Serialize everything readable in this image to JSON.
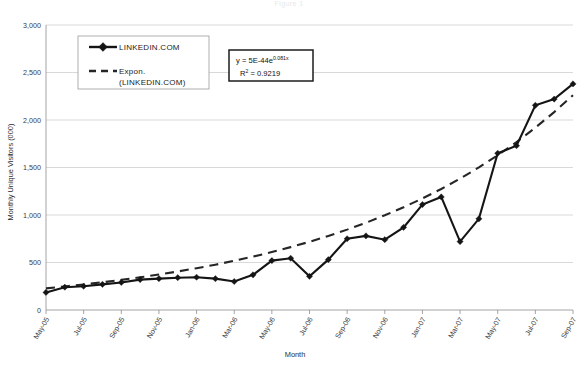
{
  "figure": {
    "title_faint": "Figure 1"
  },
  "chart_data": {
    "type": "line",
    "title": "",
    "xlabel": "Month",
    "ylabel": "Monthly Unique Visitors (000)",
    "ylim": [
      0,
      3000
    ],
    "ytick_labels": [
      "0",
      "500",
      "1,000",
      "1,500",
      "2,000",
      "2,500",
      "3,000"
    ],
    "ytick_values": [
      0,
      500,
      1000,
      1500,
      2000,
      2500,
      3000
    ],
    "grid": true,
    "legend_position": "upper-left-inside",
    "x": [
      "May-05",
      "Jun-05",
      "Jul-05",
      "Aug-05",
      "Sep-05",
      "Oct-05",
      "Nov-05",
      "Dec-05",
      "Jan-06",
      "Feb-06",
      "Mar-06",
      "Apr-06",
      "May-06",
      "Jun-06",
      "Jul-06",
      "Aug-06",
      "Sep-06",
      "Oct-06",
      "Nov-06",
      "Dec-06",
      "Jan-07",
      "Feb-07",
      "Mar-07",
      "Apr-07",
      "May-07",
      "Jun-07",
      "Jul-07",
      "Aug-07",
      "Sep-07"
    ],
    "xtick_labels": [
      "May-05",
      "Jul-05",
      "Sep-05",
      "Nov-05",
      "Jan-06",
      "Mar-06",
      "May-06",
      "Jul-06",
      "Sep-06",
      "Nov-06",
      "Jan-07",
      "Mar-07",
      "May-07",
      "Jul-07",
      "Sep-07"
    ],
    "series": [
      {
        "name": "LINKEDIN.COM",
        "style": "solid-with-diamond-markers",
        "values": [
          185,
          240,
          250,
          270,
          290,
          320,
          330,
          340,
          345,
          330,
          300,
          370,
          520,
          545,
          355,
          530,
          750,
          780,
          740,
          870,
          1110,
          1190,
          720,
          960,
          1650,
          1730,
          2155,
          2220,
          2380
        ]
      },
      {
        "name": "Expon. (LINKEDIN.COM)",
        "style": "dashed",
        "values": [
          228,
          248,
          269,
          292,
          317,
          344,
          373,
          405,
          440,
          477,
          518,
          562,
          610,
          662,
          718,
          780,
          846,
          918,
          997,
          1082,
          1174,
          1274,
          1383,
          1501,
          1629,
          1768,
          1919,
          2083,
          2261
        ]
      }
    ],
    "legend": [
      {
        "label": "LINKEDIN.COM",
        "marker": "solid-line-diamond"
      },
      {
        "label": "Expon.",
        "label2": "(LINKEDIN.COM)",
        "marker": "dashed-line"
      }
    ],
    "annotation": {
      "equation_prefix": "y = 5E-44e",
      "equation_exponent": "0.081x",
      "r2_label": "R",
      "r2_sup": "2",
      "r2_value": " = 0.9219"
    }
  }
}
